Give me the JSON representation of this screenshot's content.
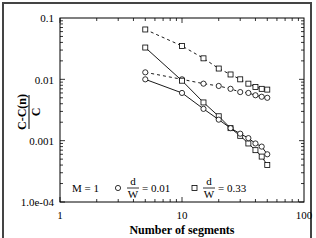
{
  "chart_data": {
    "type": "line",
    "title": "",
    "xlabel": "Number of segments",
    "ylabel_numerator": "C-C(n)",
    "ylabel_denominator": "C",
    "xscale": "log",
    "yscale": "log",
    "xlim": [
      1,
      100
    ],
    "ylim": [
      0.0001,
      0.1
    ],
    "x_ticks": [
      "1",
      "10",
      "100"
    ],
    "y_ticks": [
      "1.0e-04",
      "0.001",
      "0.01",
      "0.1"
    ],
    "grid": false,
    "x": [
      5,
      10,
      15,
      20,
      25,
      30,
      35,
      40,
      45,
      50
    ],
    "series": [
      {
        "name": "d/W = 0.33 (dashed)",
        "marker": "square",
        "linestyle": "dashed",
        "values": [
          0.065,
          0.035,
          0.022,
          0.015,
          0.012,
          0.01,
          0.0085,
          0.0075,
          0.007,
          0.0068
        ]
      },
      {
        "name": "d/W = 0.01 (dashed)",
        "marker": "circle",
        "linestyle": "dashed",
        "values": [
          0.013,
          0.01,
          0.0085,
          0.0078,
          0.007,
          0.0062,
          0.006,
          0.0055,
          0.0052,
          0.005
        ]
      },
      {
        "name": "d/W = 0.33 (solid)",
        "marker": "square",
        "linestyle": "solid",
        "values": [
          0.033,
          0.0095,
          0.0042,
          0.0025,
          0.0016,
          0.0012,
          0.0009,
          0.0007,
          0.00055,
          0.0004
        ]
      },
      {
        "name": "d/W = 0.01 (solid)",
        "marker": "circle",
        "linestyle": "solid",
        "values": [
          0.01,
          0.006,
          0.0033,
          0.0022,
          0.0016,
          0.0013,
          0.0011,
          0.0009,
          0.0008,
          0.0006
        ]
      }
    ],
    "legend": {
      "position": "lower-left inside",
      "annotation": "M = 1",
      "entries": [
        {
          "marker": "circle",
          "label_frac_num": "d",
          "label_frac_den": "W",
          "label_value": "= 0.01"
        },
        {
          "marker": "square",
          "label_frac_num": "d",
          "label_frac_den": "W",
          "label_value": "= 0.33"
        }
      ]
    }
  }
}
